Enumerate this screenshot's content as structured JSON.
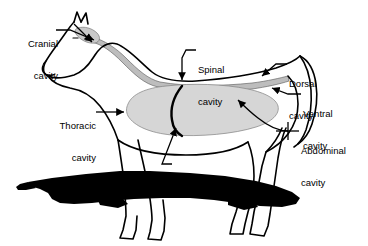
{
  "diagram": {
    "background_color": "#ffffff",
    "outline_color": "#000000",
    "cavity_fill_color": "#d6d6d6",
    "shadow_color": "#000000",
    "labels": [
      {
        "id": "cranial-cavity",
        "line1": "Cranial",
        "line2": "cavity",
        "align": "right",
        "x": 6,
        "y": 18
      },
      {
        "id": "thoracic-cavity",
        "line1": "Thoracic",
        "line2": "cavity",
        "align": "right",
        "x": 44,
        "y": 100
      },
      {
        "id": "spinal-cavity",
        "line1": "Spinal",
        "line2": "cavity",
        "align": "left",
        "x": 198,
        "y": 44
      },
      {
        "id": "dorsal-cavity",
        "line1": "Dorsal",
        "line2": "cavity",
        "align": "left",
        "x": 289,
        "y": 58
      },
      {
        "id": "ventral-cavity",
        "line1": "Ventral",
        "line2": "cavity",
        "align": "left",
        "x": 303,
        "y": 88
      },
      {
        "id": "abdominal-cavity",
        "line1": "Abdominal",
        "line2": "cavity",
        "align": "left",
        "x": 301,
        "y": 125
      },
      {
        "id": "diaphragm",
        "line1": "Diaphragm",
        "line2": "",
        "align": "left",
        "x": 175,
        "y": 160
      }
    ]
  }
}
